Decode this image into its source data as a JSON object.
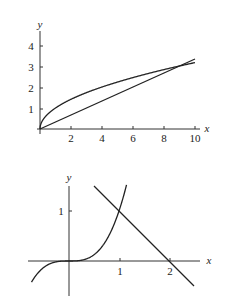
{
  "chart_data": [
    {
      "type": "line",
      "title": "",
      "xlabel": "x",
      "ylabel": "y",
      "xlim": [
        0,
        10
      ],
      "ylim": [
        0,
        4.5
      ],
      "x_ticks": [
        "2",
        "4",
        "6",
        "8",
        "10"
      ],
      "y_ticks": [
        "1",
        "2",
        "3",
        "4"
      ],
      "grid": false,
      "legend": null,
      "series": [
        {
          "name": "y = sqrt(x)",
          "x": [
            0,
            1,
            2,
            4,
            6,
            8,
            9,
            10
          ],
          "y": [
            0,
            1,
            1.41,
            2,
            2.45,
            2.83,
            3,
            3.16
          ]
        },
        {
          "name": "y = x/3",
          "x": [
            0,
            3,
            6,
            9,
            10
          ],
          "y": [
            0,
            1,
            2,
            3,
            3.33
          ]
        }
      ],
      "annotations": [
        "curves intersect at (9, 3)"
      ]
    },
    {
      "type": "line",
      "title": "",
      "xlabel": "x",
      "ylabel": "y",
      "xlim": [
        -0.8,
        2.6
      ],
      "ylim": [
        -0.7,
        1.5
      ],
      "x_ticks": [
        "1",
        "2"
      ],
      "y_ticks": [
        "1"
      ],
      "grid": false,
      "legend": null,
      "series": [
        {
          "name": "y = x^3",
          "x": [
            -0.75,
            -0.5,
            0,
            0.5,
            1,
            1.15
          ],
          "y": [
            -0.42,
            -0.125,
            0,
            0.125,
            1,
            1.52
          ]
        },
        {
          "name": "y = 2 - x",
          "x": [
            0.5,
            1,
            2,
            2.5
          ],
          "y": [
            1.5,
            1,
            0,
            -0.5
          ]
        }
      ],
      "annotations": [
        "curves intersect at (1, 1)"
      ]
    }
  ],
  "top": {
    "xlabel": "x",
    "ylabel": "y",
    "xticks": [
      "2",
      "4",
      "6",
      "8",
      "10"
    ],
    "yticks": [
      "1",
      "2",
      "3",
      "4"
    ]
  },
  "bottom": {
    "xlabel": "x",
    "ylabel": "y",
    "xticks": [
      "1",
      "2"
    ],
    "yticks": [
      "1"
    ]
  }
}
